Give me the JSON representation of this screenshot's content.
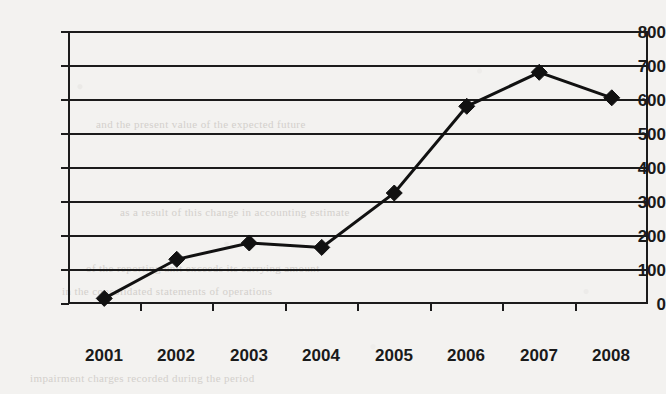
{
  "chart_data": {
    "type": "line",
    "title": "",
    "subtitle": "",
    "xlabel": "",
    "ylabel": "",
    "categories": [
      "2001",
      "2002",
      "2003",
      "2004",
      "2005",
      "2006",
      "2007",
      "2008"
    ],
    "series": [
      {
        "name": "series-1",
        "values": [
          15,
          130,
          178,
          165,
          325,
          580,
          680,
          605
        ],
        "marker": "diamond",
        "marker_color": "#111111",
        "line_color": "#111111",
        "line_width": 3
      }
    ],
    "ylim": [
      0,
      800
    ],
    "yticks": [
      0,
      100,
      200,
      300,
      400,
      500,
      600,
      700,
      800
    ],
    "ytick_labels": [
      "0",
      "100",
      "200",
      "300",
      "400",
      "500",
      "600",
      "700",
      "800"
    ],
    "xtick_labels": [
      "2001",
      "2002",
      "2003",
      "2004",
      "2005",
      "2006",
      "2007",
      "2008"
    ],
    "grid": true,
    "grid_axis": "y",
    "legend": false,
    "legend_position": "none",
    "plot_border": true,
    "background_color": "#f3f2f0",
    "axis_color": "#1b1b1b"
  },
  "ghost_text": {
    "line1": "and the present value of the expected future",
    "line2": "as a result of this change in accounting estimate",
    "line3": "of the reporting unit exceeds its carrying amount",
    "line4": "in the consolidated statements of operations",
    "line5": "impairment charges recorded during the period"
  }
}
